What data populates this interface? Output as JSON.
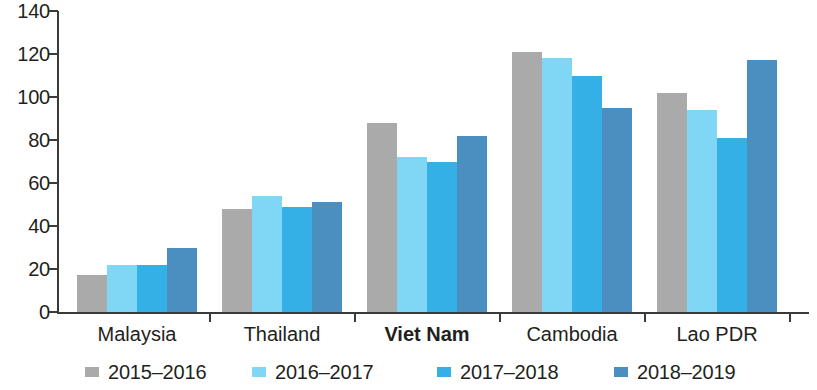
{
  "chart_data": {
    "type": "bar",
    "title": "",
    "subtitle": "",
    "xlabel": "",
    "ylabel": "",
    "ylim": [
      0,
      140
    ],
    "yticks": [
      0,
      20,
      40,
      60,
      80,
      100,
      120,
      140
    ],
    "grid": false,
    "legend_position": "bottom",
    "highlighted_category": "Viet Nam",
    "categories": [
      "Malaysia",
      "Thailand",
      "Viet Nam",
      "Cambodia",
      "Lao PDR"
    ],
    "series": [
      {
        "name": "2015–2016",
        "color": "#aaaaaa",
        "values": [
          17,
          48,
          88,
          121,
          102
        ]
      },
      {
        "name": "2016–2017",
        "color": "#7fd7f5",
        "values": [
          22,
          54,
          72,
          118,
          94
        ]
      },
      {
        "name": "2017–2018",
        "color": "#34b0e6",
        "values": [
          22,
          49,
          70,
          110,
          81
        ]
      },
      {
        "name": "2018–2019",
        "color": "#4a8fbf",
        "values": [
          30,
          51,
          82,
          95,
          117
        ]
      }
    ]
  },
  "axis": {
    "tick_labels": [
      "140",
      "120",
      "100",
      "80",
      "60",
      "40",
      "20",
      "0"
    ]
  },
  "legend": {
    "entries": [
      {
        "label": "2015–2016",
        "color": "#aaaaaa"
      },
      {
        "label": "2016–2017",
        "color": "#7fd7f5"
      },
      {
        "label": "2017–2018",
        "color": "#34b0e6"
      },
      {
        "label": "2018–2019",
        "color": "#4a8fbf"
      }
    ]
  }
}
